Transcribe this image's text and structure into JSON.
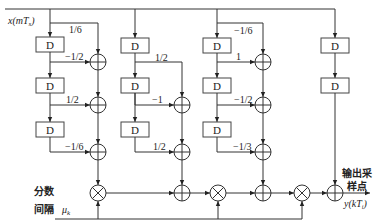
{
  "diagram": {
    "input_label": "x(mT_s)",
    "input_label_main": "x(mT",
    "input_label_sub": "s",
    "input_label_close": ")",
    "output_label_main": "y(kT",
    "output_label_sub": "i",
    "output_label_close": ")",
    "output_caption_line1": "输出采",
    "output_caption_line2": "样点",
    "mu_caption_line1": "分数",
    "mu_caption_line2": "间隔",
    "mu_symbol": "μ",
    "mu_sub": "k",
    "delay_label": "D",
    "columns": [
      {
        "name": "branch-1",
        "delays": 3,
        "coefficients": [
          "1/6",
          "-1/2",
          "1/2",
          "-1/6"
        ]
      },
      {
        "name": "branch-2",
        "delays": 2,
        "coefficients": [
          "1/2",
          "-1",
          "1/2"
        ]
      },
      {
        "name": "branch-3",
        "delays": 3,
        "coefficients": [
          "-1/6",
          "1",
          "-1/2",
          "-1/3"
        ]
      },
      {
        "name": "branch-4",
        "delays": 2,
        "coefficients": []
      }
    ],
    "coef": {
      "c1_0": "1/6",
      "c1_1": "−1/2",
      "c1_2": "1/2",
      "c1_3": "−1/6",
      "c2_0": "1/2",
      "c2_1": "−1",
      "c2_2": "1/2",
      "c3_0": "−1/6",
      "c3_1": "1",
      "c3_2": "−1/2",
      "c3_3": "−1/3"
    },
    "colors": {
      "line": "#333333",
      "background": "#ffffff"
    }
  }
}
